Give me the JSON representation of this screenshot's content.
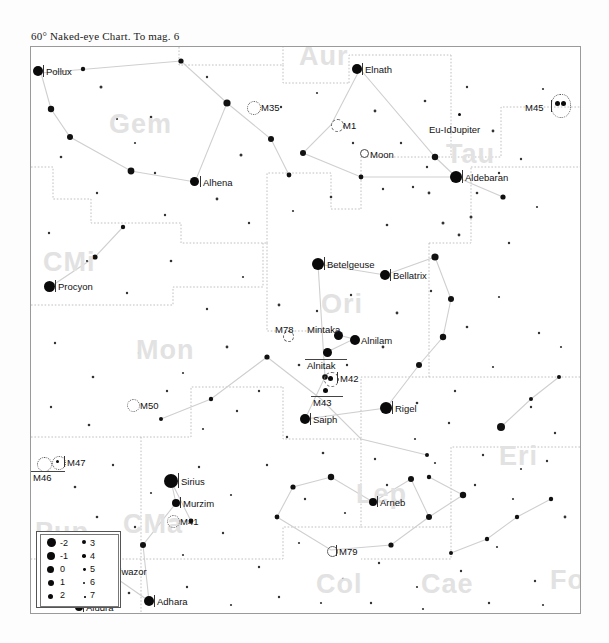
{
  "chart": {
    "title": "60° Naked-eye Chart. To mag. 6",
    "field_of_view_deg": 60,
    "limiting_magnitude": 6,
    "frame": {
      "x": 30,
      "y": 46,
      "width": 549,
      "height": 566
    }
  },
  "legend": {
    "title": "magnitude-legend",
    "left_column": [
      "-2",
      "-1",
      "0",
      "1",
      "2"
    ],
    "right_column": [
      "3",
      "4",
      "5",
      "6",
      "7"
    ],
    "left_sizes": [
      9,
      8,
      7,
      6,
      5
    ],
    "right_sizes": [
      4.4,
      3.6,
      2.8,
      2.2,
      1.6
    ]
  },
  "constellations": [
    {
      "name": "Aur",
      "x": 268,
      "y": -6
    },
    {
      "name": "Gem",
      "x": 78,
      "y": 62
    },
    {
      "name": "Tau",
      "x": 415,
      "y": 92
    },
    {
      "name": "CMi",
      "x": 12,
      "y": 200
    },
    {
      "name": "Ori",
      "x": 290,
      "y": 242
    },
    {
      "name": "Mon",
      "x": 105,
      "y": 288
    },
    {
      "name": "Eri",
      "x": 468,
      "y": 394
    },
    {
      "name": "Pup",
      "x": 4,
      "y": 470
    },
    {
      "name": "CMa",
      "x": 92,
      "y": 462
    },
    {
      "name": "Lep",
      "x": 325,
      "y": 432
    },
    {
      "name": "Col",
      "x": 285,
      "y": 522
    },
    {
      "name": "Cae",
      "x": 390,
      "y": 522
    },
    {
      "name": "Fo",
      "x": 519,
      "y": 518
    }
  ],
  "named_stars": [
    {
      "name": "Pollux",
      "x": 7,
      "y": 24,
      "mag": -1.0,
      "label_dx": 9,
      "label_dy": -5
    },
    {
      "name": "Elnath",
      "x": 326,
      "y": 22,
      "mag": -1.0,
      "label_dx": 9,
      "label_dy": -5
    },
    {
      "name": "Aldebaran",
      "x": 425,
      "y": 130,
      "mag": -1.5,
      "label_dx": 9,
      "label_dy": -5
    },
    {
      "name": "Alhena",
      "x": 164,
      "y": 135,
      "mag": -0.5,
      "label_dx": 9,
      "label_dy": -5
    },
    {
      "name": "Betelgeuse",
      "x": 287,
      "y": 217,
      "mag": -1.5,
      "label_dx": 9,
      "label_dy": -5
    },
    {
      "name": "Bellatrix",
      "x": 354,
      "y": 228,
      "mag": -0.8,
      "label_dx": 9,
      "label_dy": -5
    },
    {
      "name": "Procyon",
      "x": 19,
      "y": 240,
      "mag": -1.3,
      "label_dx": 9,
      "label_dy": -5
    },
    {
      "name": "Mintaka",
      "x": 307,
      "y": 288,
      "mag": -0.6,
      "label_dx": -2,
      "label_dy": -11
    },
    {
      "name": "Alnilam",
      "x": 323,
      "y": 292,
      "mag": -0.8,
      "label_dx": 9,
      "label_dy": -5
    },
    {
      "name": "Alnitak",
      "x": 296,
      "y": 305,
      "mag": -0.6,
      "label_dx": -5,
      "label_dy": 6
    },
    {
      "name": "Rigel",
      "x": 355,
      "y": 361,
      "mag": -1.6,
      "label_dx": 9,
      "label_dy": -5
    },
    {
      "name": "Saiph",
      "x": 274,
      "y": 372,
      "mag": -0.7,
      "label_dx": 9,
      "label_dy": -5
    },
    {
      "name": "Sirius",
      "x": 140,
      "y": 434,
      "mag": -2.0,
      "label_dx": 9,
      "label_dy": -5
    },
    {
      "name": "Murzim",
      "x": 145,
      "y": 456,
      "mag": -0.3,
      "label_dx": 9,
      "label_dy": -5
    },
    {
      "name": "Arneb",
      "x": 342,
      "y": 455,
      "mag": -0.4,
      "label_dx": 9,
      "label_dy": -5
    },
    {
      "name": "Alwazor",
      "x": 75,
      "y": 524,
      "mag": -0.5,
      "label_dx": 9,
      "label_dy": -5
    },
    {
      "name": "Adhara",
      "x": 118,
      "y": 554,
      "mag": -0.6,
      "label_dx": 9,
      "label_dy": -5
    },
    {
      "name": "Aludra",
      "x": 48,
      "y": 560,
      "mag": -0.3,
      "label_dx": 9,
      "label_dy": -5
    }
  ],
  "deep_sky_objects": [
    {
      "name": "M35",
      "type": "open-cluster",
      "x": 222,
      "y": 60,
      "size": 12,
      "label_dx": 9,
      "label_dy": -5
    },
    {
      "name": "M1",
      "type": "nebula",
      "x": 305,
      "y": 78,
      "size": 11,
      "label_dx": 8,
      "label_dy": -5
    },
    {
      "name": "M45",
      "type": "open-cluster",
      "x": 534,
      "y": 60,
      "size": 16,
      "label_dx": -30,
      "label_dy": -1
    },
    {
      "name": "M78",
      "type": "nebula",
      "x": 256,
      "y": 288,
      "size": 9,
      "label_dx": -4,
      "label_dy": -11
    },
    {
      "name": "M42",
      "type": "nebula",
      "x": 299,
      "y": 331,
      "size": 13,
      "label_dx": 9,
      "label_dy": -5
    },
    {
      "name": "M43",
      "type": "nebula",
      "x": 295,
      "y": 344,
      "size": 7,
      "label_dx": -6,
      "label_dy": 5
    },
    {
      "name": "M50",
      "type": "open-cluster",
      "x": 101,
      "y": 358,
      "size": 11,
      "label_dx": 9,
      "label_dy": -5
    },
    {
      "name": "M47",
      "type": "open-cluster",
      "x": 26,
      "y": 415,
      "size": 12,
      "label_dx": 9,
      "label_dy": -5
    },
    {
      "name": "M46",
      "type": "open-cluster",
      "x": 13,
      "y": 416,
      "size": 13,
      "label_dx": -5,
      "label_dy": 8
    },
    {
      "name": "M41",
      "type": "open-cluster",
      "x": 141,
      "y": 474,
      "size": 11,
      "label_dx": 9,
      "label_dy": -5
    },
    {
      "name": "M79",
      "type": "globular",
      "x": 300,
      "y": 503,
      "size": 8,
      "label_dx": 8,
      "label_dy": -5
    }
  ],
  "solar_system": [
    {
      "name": "Moon",
      "x": 333,
      "y": 106,
      "size": 7,
      "label_dx": 9,
      "label_dy": -5
    },
    {
      "name": "Eu-IdJupiter",
      "x": 414,
      "y": 82,
      "size": 0,
      "label_dx": 0,
      "label_dy": 0
    }
  ]
}
